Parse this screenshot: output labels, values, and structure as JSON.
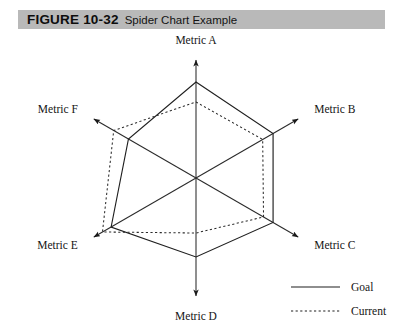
{
  "figure": {
    "label": "FIGURE 10-32",
    "title": "Spider Chart Example",
    "band_color": "#b9b9b9"
  },
  "chart_data": {
    "type": "radar",
    "title": "Spider Chart Example",
    "xlabel": "",
    "ylabel": "",
    "grid": false,
    "legend_position": "bottom-right",
    "categories": [
      "Metric A",
      "Metric B",
      "Metric C",
      "Metric D",
      "Metric E",
      "Metric F"
    ],
    "axis_angles_deg": [
      90,
      30,
      -30,
      -90,
      -150,
      150
    ],
    "rlim": [
      0,
      120
    ],
    "series": [
      {
        "name": "Goal",
        "style": "solid",
        "color": "#1a1a1a",
        "values": [
          96,
          89,
          89,
          79,
          98,
          78
        ]
      },
      {
        "name": "Current",
        "style": "dotted",
        "color": "#1a1a1a",
        "values": [
          76,
          77,
          78,
          55,
          108,
          95
        ]
      }
    ],
    "annotations": []
  },
  "axes": {
    "labels": [
      {
        "name": "Metric A",
        "position": "top"
      },
      {
        "name": "Metric B",
        "position": "upper-right"
      },
      {
        "name": "Metric C",
        "position": "lower-right"
      },
      {
        "name": "Metric D",
        "position": "bottom"
      },
      {
        "name": "Metric E",
        "position": "lower-left"
      },
      {
        "name": "Metric F",
        "position": "upper-left"
      }
    ]
  },
  "legend": {
    "items": [
      {
        "label": "Goal",
        "style": "solid"
      },
      {
        "label": "Current",
        "style": "dotted"
      }
    ]
  }
}
